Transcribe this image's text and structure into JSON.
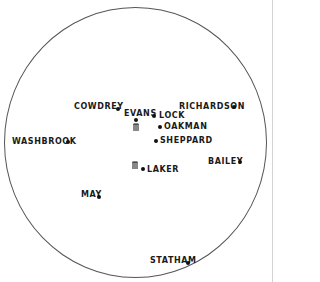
{
  "diagram": {
    "type": "cricket-fielding-positions",
    "colors": {
      "boundary": "#555555",
      "text": "#1a1a1a",
      "marker": "#111111"
    },
    "stumps": [
      {
        "name": "batting-end-stumps",
        "x": 133,
        "y": 123
      },
      {
        "name": "bowling-end-stumps",
        "x": 132,
        "y": 161
      }
    ],
    "fielders": [
      {
        "label": "COWDREY",
        "label_x": 74,
        "label_y": 103,
        "dot_x": 118,
        "dot_y": 109
      },
      {
        "label": "EVANS",
        "label_x": 124,
        "label_y": 110,
        "dot_x": 136,
        "dot_y": 119
      },
      {
        "label": "LOCK",
        "label_x": 159,
        "label_y": 112,
        "dot_x": 154,
        "dot_y": 116
      },
      {
        "label": "RICHARDSON",
        "label_x": 179,
        "label_y": 103,
        "dot_x": 234,
        "dot_y": 107
      },
      {
        "label": "OAKMAN",
        "label_x": 164,
        "label_y": 123,
        "dot_x": 160,
        "dot_y": 127
      },
      {
        "label": "SHEPPARD",
        "label_x": 160,
        "label_y": 137,
        "dot_x": 156,
        "dot_y": 141
      },
      {
        "label": "WASHBROOK",
        "label_x": 12,
        "label_y": 138,
        "dot_x": 68,
        "dot_y": 142
      },
      {
        "label": "BAILEY",
        "label_x": 208,
        "label_y": 158,
        "dot_x": 240,
        "dot_y": 162
      },
      {
        "label": "LAKER",
        "label_x": 147,
        "label_y": 166,
        "dot_x": 143,
        "dot_y": 169
      },
      {
        "label": "MAY",
        "label_x": 81,
        "label_y": 191,
        "dot_x": 99,
        "dot_y": 197
      },
      {
        "label": "STATHAM",
        "label_x": 150,
        "label_y": 257,
        "dot_x": 188,
        "dot_y": 263
      }
    ]
  }
}
